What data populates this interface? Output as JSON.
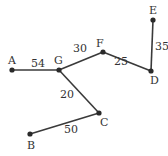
{
  "diagram": {
    "type": "weighted-graph-tree",
    "nodes": [
      {
        "id": "A",
        "label": "A",
        "x": 12,
        "y": 70,
        "lx": 8,
        "ly": 55
      },
      {
        "id": "G",
        "label": "G",
        "x": 59,
        "y": 70,
        "lx": 54,
        "ly": 55
      },
      {
        "id": "F",
        "label": "F",
        "x": 103,
        "y": 52,
        "lx": 96,
        "ly": 38
      },
      {
        "id": "D",
        "label": "D",
        "x": 151,
        "y": 71,
        "lx": 150,
        "ly": 75
      },
      {
        "id": "E",
        "label": "E",
        "x": 153,
        "y": 20,
        "lx": 149,
        "ly": 5
      },
      {
        "id": "C",
        "label": "C",
        "x": 99,
        "y": 113,
        "lx": 100,
        "ly": 117
      },
      {
        "id": "B",
        "label": "B",
        "x": 30,
        "y": 134,
        "lx": 27,
        "ly": 140
      }
    ],
    "edges": [
      {
        "from": "A",
        "to": "G",
        "weight": "54",
        "lx": 31,
        "ly": 58
      },
      {
        "from": "G",
        "to": "F",
        "weight": "30",
        "lx": 73,
        "ly": 43
      },
      {
        "from": "F",
        "to": "D",
        "weight": "25",
        "lx": 114,
        "ly": 56
      },
      {
        "from": "D",
        "to": "E",
        "weight": "35",
        "lx": 155,
        "ly": 41
      },
      {
        "from": "G",
        "to": "C",
        "weight": "20",
        "lx": 60,
        "ly": 89
      },
      {
        "from": "C",
        "to": "B",
        "weight": "50",
        "lx": 64,
        "ly": 124
      }
    ],
    "colors": {
      "edge": "#3a3a3a",
      "node": "#2a2a2a",
      "text": "#333333"
    }
  }
}
